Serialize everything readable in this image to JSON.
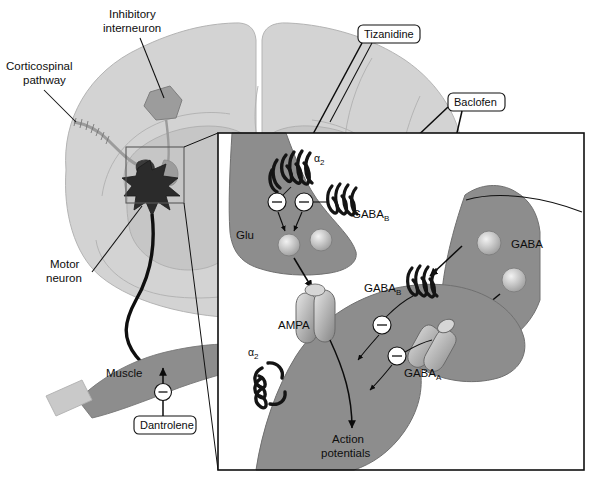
{
  "figure": {
    "domain_note": "neuroanatomy-pharmacology-diagram"
  },
  "anatomy_labels": {
    "inhibitory_interneuron": {
      "line1": "Inhibitory",
      "line2": "interneuron"
    },
    "corticospinal_pathway": {
      "line1": "Corticospinal",
      "line2": "pathway"
    },
    "motor_neuron": {
      "line1": "Motor",
      "line2": "neuron"
    },
    "muscle": "Muscle"
  },
  "drug_labels": [
    {
      "name": "tizanidine",
      "text": "Tizanidine"
    },
    {
      "name": "baclofen",
      "text": "Baclofen"
    },
    {
      "name": "dantrolene",
      "text": "Dantrolene"
    },
    {
      "name": "benzodiazepines",
      "text": "Benzodiazepines"
    }
  ],
  "inset_labels": {
    "alpha2_presynaptic": {
      "base": "α",
      "sub": "2"
    },
    "alpha2_postsynaptic": {
      "base": "α",
      "sub": "2"
    },
    "glu": "Glu",
    "gaba": "GABA",
    "gaba_b_presynaptic": {
      "base": "GABA",
      "sub": "B"
    },
    "gaba_b_postsynaptic": {
      "base": "GABA",
      "sub": "B"
    },
    "gaba_a_postsynaptic": {
      "base": "GABA",
      "sub": "A"
    },
    "ampa": "AMPA",
    "action_potentials": {
      "line1": "Action",
      "line2": "potentials"
    }
  },
  "minus_signs": [
    {
      "name": "minus-glu-terminal-left"
    },
    {
      "name": "minus-glu-terminal-right"
    },
    {
      "name": "minus-gabab-postsynaptic"
    },
    {
      "name": "minus-gabaa-postsynaptic"
    },
    {
      "name": "minus-muscle-dantrolene"
    }
  ],
  "colors": {
    "page_background": "#ffffff",
    "spinal_cord_white_matter": "#d3d3d3",
    "spinal_cord_gray_matter": "#c6c6c6",
    "interneuron_fill": "#9c9c9c",
    "motor_neuron_soma": "#2b2b2b",
    "neuron_gray": "#8d8d8d",
    "muscle_gray": "#8d8d8d",
    "tendon_gray": "#c9c9c9",
    "receptor_dark": "#1a1a1a",
    "vesicle_light": "#b9b9b9",
    "outline": "#101010"
  }
}
